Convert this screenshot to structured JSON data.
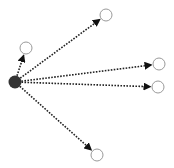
{
  "diagram": {
    "type": "star-graph",
    "colors": {
      "source_fill": "#333333",
      "target_stroke": "#9a9a9a",
      "target_fill": "#ffffff",
      "edge": "#222222"
    },
    "source": {
      "id": "source",
      "x": 15,
      "y": 82,
      "r": 6.5
    },
    "targets": [
      {
        "id": "t1",
        "x": 26,
        "y": 48,
        "r": 6
      },
      {
        "id": "t2",
        "x": 106,
        "y": 15,
        "r": 6
      },
      {
        "id": "t3",
        "x": 159,
        "y": 64,
        "r": 6
      },
      {
        "id": "t4",
        "x": 158,
        "y": 87,
        "r": 6
      },
      {
        "id": "t5",
        "x": 97,
        "y": 155,
        "r": 6
      }
    ],
    "edges": [
      {
        "from": "source",
        "to": "t1",
        "style": "dotted",
        "arrow": "end"
      },
      {
        "from": "source",
        "to": "t2",
        "style": "dotted",
        "arrow": "end"
      },
      {
        "from": "source",
        "to": "t3",
        "style": "dotted",
        "arrow": "end"
      },
      {
        "from": "source",
        "to": "t4",
        "style": "dotted",
        "arrow": "end"
      },
      {
        "from": "source",
        "to": "t5",
        "style": "dotted",
        "arrow": "end"
      }
    ]
  }
}
